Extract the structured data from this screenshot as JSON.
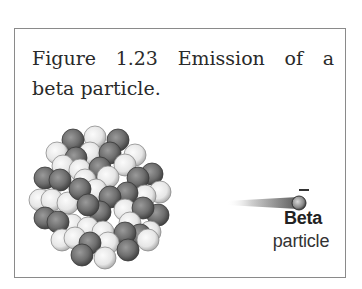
{
  "figure": {
    "caption_line1": "Figure 1.23  Emission of a",
    "caption_line2": "beta particle.",
    "beta_label": "Beta",
    "particle_label": "particle",
    "charge_symbol": "−"
  },
  "colors": {
    "frame_border": "#8a8a8a",
    "dark_nucleon": "#6e6e6e",
    "light_nucleon": "#e8e8e8",
    "text": "#2a2a2a"
  },
  "nucleus": {
    "radius": 11,
    "balls": [
      {
        "x": 95,
        "y": 137,
        "t": "L"
      },
      {
        "x": 73,
        "y": 140,
        "t": "D"
      },
      {
        "x": 118,
        "y": 140,
        "t": "D"
      },
      {
        "x": 57,
        "y": 153,
        "t": "L"
      },
      {
        "x": 135,
        "y": 155,
        "t": "L"
      },
      {
        "x": 90,
        "y": 153,
        "t": "L"
      },
      {
        "x": 110,
        "y": 153,
        "t": "D"
      },
      {
        "x": 76,
        "y": 158,
        "t": "D"
      },
      {
        "x": 63,
        "y": 166,
        "t": "L"
      },
      {
        "x": 125,
        "y": 165,
        "t": "L"
      },
      {
        "x": 80,
        "y": 170,
        "t": "L"
      },
      {
        "x": 100,
        "y": 168,
        "t": "D"
      },
      {
        "x": 152,
        "y": 174,
        "t": "D"
      },
      {
        "x": 45,
        "y": 178,
        "t": "D"
      },
      {
        "x": 108,
        "y": 177,
        "t": "L"
      },
      {
        "x": 85,
        "y": 180,
        "t": "L"
      },
      {
        "x": 60,
        "y": 180,
        "t": "D"
      },
      {
        "x": 138,
        "y": 178,
        "t": "D"
      },
      {
        "x": 160,
        "y": 192,
        "t": "L"
      },
      {
        "x": 40,
        "y": 200,
        "t": "L"
      },
      {
        "x": 52,
        "y": 200,
        "t": "L"
      },
      {
        "x": 145,
        "y": 196,
        "t": "L"
      },
      {
        "x": 127,
        "y": 193,
        "t": "D"
      },
      {
        "x": 96,
        "y": 190,
        "t": "L"
      },
      {
        "x": 68,
        "y": 203,
        "t": "L"
      },
      {
        "x": 80,
        "y": 189,
        "t": "D"
      },
      {
        "x": 110,
        "y": 197,
        "t": "D"
      },
      {
        "x": 158,
        "y": 215,
        "t": "D"
      },
      {
        "x": 125,
        "y": 210,
        "t": "L"
      },
      {
        "x": 143,
        "y": 208,
        "t": "D"
      },
      {
        "x": 100,
        "y": 212,
        "t": "D"
      },
      {
        "x": 88,
        "y": 205,
        "t": "D"
      },
      {
        "x": 45,
        "y": 218,
        "t": "D"
      },
      {
        "x": 72,
        "y": 225,
        "t": "L"
      },
      {
        "x": 130,
        "y": 223,
        "t": "L"
      },
      {
        "x": 58,
        "y": 222,
        "t": "D"
      },
      {
        "x": 88,
        "y": 228,
        "t": "L"
      },
      {
        "x": 103,
        "y": 232,
        "t": "L"
      },
      {
        "x": 150,
        "y": 232,
        "t": "L"
      },
      {
        "x": 140,
        "y": 235,
        "t": "D"
      },
      {
        "x": 62,
        "y": 240,
        "t": "L"
      },
      {
        "x": 75,
        "y": 238,
        "t": "L"
      },
      {
        "x": 148,
        "y": 240,
        "t": "L"
      },
      {
        "x": 125,
        "y": 233,
        "t": "D"
      },
      {
        "x": 108,
        "y": 243,
        "t": "L"
      },
      {
        "x": 90,
        "y": 243,
        "t": "D"
      },
      {
        "x": 82,
        "y": 255,
        "t": "D"
      },
      {
        "x": 128,
        "y": 250,
        "t": "D"
      },
      {
        "x": 105,
        "y": 258,
        "t": "L"
      }
    ]
  },
  "beta_particle": {
    "trail_start_x": 226,
    "trail_end_x": 298,
    "center_y": 203,
    "ball_cx": 299,
    "ball_cy": 203,
    "ball_r": 7
  }
}
